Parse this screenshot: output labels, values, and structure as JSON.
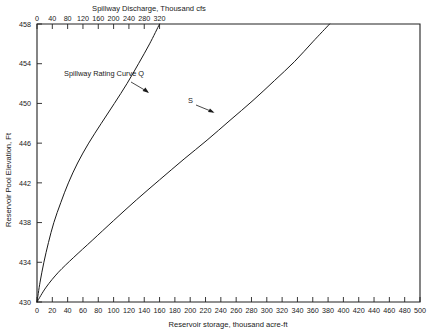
{
  "figure": {
    "background_color": "#ffffff",
    "line_color": "#1a1a1a"
  },
  "chart_data": {
    "type": "line",
    "title": "",
    "xlabel": "Reservoir storage, thousand acre-ft",
    "ylabel": "Reservoir Pool Elevation, Ft",
    "x2label": "Spillway Discharge, Thousand cfs",
    "grid": false,
    "legend": "none",
    "xlim": [
      0,
      500
    ],
    "ylim": [
      430,
      458
    ],
    "x2lim": [
      0,
      320
    ],
    "xticks": [
      0,
      20,
      40,
      60,
      80,
      100,
      120,
      140,
      160,
      180,
      200,
      220,
      240,
      260,
      280,
      300,
      320,
      340,
      360,
      380,
      400,
      420,
      440,
      460,
      480,
      500
    ],
    "xticklabels": [
      "0",
      "20",
      "40",
      "60",
      "80",
      "100",
      "120",
      "140",
      "160",
      "180",
      "200",
      "220",
      "240",
      "260",
      "280",
      "300",
      "320",
      "340",
      "360",
      "380",
      "400",
      "420",
      "440",
      "460",
      "480",
      "500"
    ],
    "yticks": [
      430,
      434,
      438,
      442,
      446,
      450,
      454,
      458
    ],
    "yticklabels": [
      "430",
      "434",
      "438",
      "442",
      "446",
      "450",
      "454",
      "458"
    ],
    "x2ticks": [
      0,
      40,
      80,
      120,
      160,
      200,
      240,
      280,
      320
    ],
    "x2ticklabels": [
      "0",
      "40",
      "80",
      "120",
      "160",
      "200",
      "240",
      "280",
      "320"
    ],
    "series": [
      {
        "name": "Spillway Rating Curve Q",
        "axis": "x2",
        "annotation": "Spillway Rating Curve Q",
        "points": [
          [
            0,
            430.0
          ],
          [
            8,
            432.0
          ],
          [
            18,
            434.0
          ],
          [
            30,
            436.0
          ],
          [
            44,
            438.0
          ],
          [
            62,
            440.0
          ],
          [
            82,
            442.0
          ],
          [
            106,
            444.0
          ],
          [
            135,
            446.0
          ],
          [
            168,
            448.0
          ],
          [
            202,
            450.0
          ],
          [
            235,
            452.0
          ],
          [
            265,
            454.0
          ],
          [
            294,
            456.0
          ],
          [
            320,
            458.0
          ]
        ]
      },
      {
        "name": "S",
        "axis": "x1",
        "annotation": "S",
        "points": [
          [
            0,
            430.0
          ],
          [
            12,
            431.5
          ],
          [
            28,
            433.0
          ],
          [
            48,
            434.5
          ],
          [
            72,
            436.2
          ],
          [
            100,
            438.2
          ],
          [
            130,
            440.3
          ],
          [
            160,
            442.3
          ],
          [
            192,
            444.4
          ],
          [
            222,
            446.3
          ],
          [
            252,
            448.3
          ],
          [
            282,
            450.3
          ],
          [
            310,
            452.3
          ],
          [
            336,
            454.2
          ],
          [
            360,
            456.2
          ],
          [
            382,
            458.0
          ]
        ]
      }
    ],
    "annotations": [
      {
        "text": "Spillway Rating Curve Q",
        "target_series": "Spillway Rating Curve Q"
      },
      {
        "text": "S",
        "target_series": "S"
      }
    ]
  }
}
